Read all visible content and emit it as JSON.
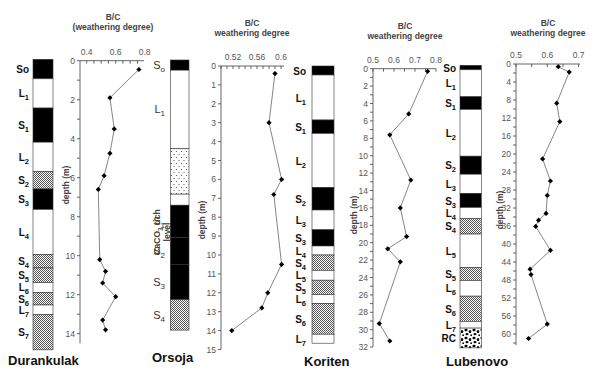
{
  "figure": {
    "depth_axis_label": "depth (m)",
    "x_axis_title_line1": "B/C",
    "calcium_label": "CaCO₃ rich level"
  },
  "colors": {
    "soil_black": "#000000",
    "loess_white": "#ffffff",
    "hatch": "#777777",
    "line": "#777777",
    "axis": "#555555"
  },
  "chart_data": [
    {
      "type": "line",
      "site": "Durankulak",
      "title": "B/C (weathering degree)",
      "xlabel": "B/C (weathering degree)",
      "ylabel": "depth (m)",
      "xlim": [
        0.4,
        0.8
      ],
      "ylim": [
        0,
        14.5
      ],
      "x_ticks": [
        "0.4",
        "0.6",
        "0.8"
      ],
      "y_ticks": [
        "0",
        "2",
        "4",
        "6",
        "8",
        "10",
        "12",
        "14"
      ],
      "depth": [
        0.45,
        1.9,
        3.5,
        4.75,
        5.9,
        6.6,
        10.2,
        10.8,
        11.4,
        12.1,
        13.3,
        13.8
      ],
      "values": [
        0.76,
        0.56,
        0.59,
        0.56,
        0.52,
        0.48,
        0.49,
        0.53,
        0.51,
        0.6,
        0.51,
        0.53
      ],
      "stratigraphy": [
        {
          "label": "So",
          "sub": "",
          "type": "soil",
          "top": 0.0,
          "bottom": 1.0
        },
        {
          "label": "L",
          "sub": "1",
          "type": "loess",
          "top": 1.0,
          "bottom": 2.5
        },
        {
          "label": "S",
          "sub": "1",
          "type": "soil",
          "top": 2.5,
          "bottom": 4.25
        },
        {
          "label": "L",
          "sub": "2",
          "type": "loess",
          "top": 4.25,
          "bottom": 5.75
        },
        {
          "label": "S",
          "sub": "2",
          "type": "hatch",
          "top": 5.75,
          "bottom": 6.65
        },
        {
          "label": "S",
          "sub": "3",
          "type": "soil",
          "top": 6.65,
          "bottom": 7.7
        },
        {
          "label": "L",
          "sub": "4",
          "type": "loess",
          "top": 7.7,
          "bottom": 10.0
        },
        {
          "label": "S",
          "sub": "4",
          "type": "hatch",
          "top": 10.0,
          "bottom": 10.7
        },
        {
          "label": "S",
          "sub": "5",
          "type": "hatch",
          "top": 10.7,
          "bottom": 11.45
        },
        {
          "label": "L",
          "sub": "6",
          "type": "loess",
          "top": 11.45,
          "bottom": 11.95
        },
        {
          "label": "S",
          "sub": "6",
          "type": "hatch",
          "top": 11.95,
          "bottom": 12.6
        },
        {
          "label": "L",
          "sub": "7",
          "type": "loess",
          "top": 12.6,
          "bottom": 13.1
        },
        {
          "label": "S",
          "sub": "7",
          "type": "hatch",
          "top": 13.1,
          "bottom": 14.9
        }
      ]
    },
    {
      "type": "line",
      "site": "Orsoja",
      "title": "B/C weathering degree",
      "xlabel": "B/C weathering degree",
      "ylabel": "depth (m)",
      "xlim": [
        0.5,
        0.605
      ],
      "ylim": [
        0,
        15
      ],
      "x_ticks": [
        "0.52",
        "0.56",
        "0.6"
      ],
      "y_ticks": [
        "0",
        "1",
        "2",
        "3",
        "4",
        "5",
        "6",
        "7",
        "8",
        "9",
        "10",
        "11",
        "12",
        "13",
        "14",
        "15"
      ],
      "depth": [
        0.4,
        3.0,
        6.0,
        6.8,
        10.5,
        12.0,
        12.8,
        14.0
      ],
      "values": [
        0.59,
        0.58,
        0.601,
        0.588,
        0.601,
        0.578,
        0.568,
        0.518
      ],
      "stratigraphy": [
        {
          "label": "S",
          "sub": "o",
          "type": "soil",
          "top": 0.0,
          "bottom": 0.55
        },
        {
          "label": "L",
          "sub": "1",
          "type": "loess",
          "top": 0.55,
          "bottom": 4.8
        },
        {
          "label": "",
          "sub": "",
          "type": "dotted",
          "top": 4.8,
          "bottom": 7.25
        },
        {
          "label": "",
          "sub": "",
          "type": "loess",
          "top": 7.25,
          "bottom": 7.85
        },
        {
          "label": "S",
          "sub": "1",
          "type": "soil",
          "top": 7.85,
          "bottom": 9.6
        },
        {
          "label": "S",
          "sub": "2",
          "type": "soil",
          "top": 9.6,
          "bottom": 11.05
        },
        {
          "label": "S",
          "sub": "3",
          "type": "soil",
          "top": 11.05,
          "bottom": 12.95
        },
        {
          "label": "S",
          "sub": "4",
          "type": "hatch",
          "top": 12.95,
          "bottom": 14.6
        }
      ]
    },
    {
      "type": "line",
      "site": "Koriten",
      "title": "B/C weathering degree",
      "xlabel": "B/C weathering degree",
      "ylabel": "depth (m)",
      "xlim": [
        0.5,
        0.8
      ],
      "ylim": [
        0,
        32
      ],
      "x_ticks": [
        "0.5",
        "0.6",
        "0.7",
        "0.8"
      ],
      "y_ticks": [
        "0",
        "2",
        "4",
        "6",
        "8",
        "10",
        "12",
        "14",
        "16",
        "18",
        "20",
        "22",
        "24",
        "26",
        "28",
        "30",
        "32"
      ],
      "depth": [
        0.3,
        5.2,
        7.6,
        12.8,
        16.0,
        19.3,
        20.7,
        22.2,
        29.3,
        31.3
      ],
      "values": [
        0.76,
        0.67,
        0.58,
        0.68,
        0.63,
        0.66,
        0.57,
        0.63,
        0.53,
        0.58
      ],
      "stratigraphy": [
        {
          "label": "So",
          "sub": "",
          "type": "soil",
          "top": 0.0,
          "bottom": 1.0
        },
        {
          "label": "L",
          "sub": "1",
          "type": "loess",
          "top": 1.0,
          "bottom": 6.0
        },
        {
          "label": "S",
          "sub": "1",
          "type": "soil",
          "top": 6.0,
          "bottom": 7.5
        },
        {
          "label": "L",
          "sub": "2",
          "type": "loess",
          "top": 7.5,
          "bottom": 13.5
        },
        {
          "label": "S",
          "sub": "2",
          "type": "soil",
          "top": 13.5,
          "bottom": 16.0
        },
        {
          "label": "L",
          "sub": "3",
          "type": "loess",
          "top": 16.0,
          "bottom": 18.2
        },
        {
          "label": "S",
          "sub": "3",
          "type": "soil",
          "top": 18.2,
          "bottom": 20.0
        },
        {
          "label": "L",
          "sub": "4",
          "type": "loess",
          "top": 20.0,
          "bottom": 21.0
        },
        {
          "label": "S",
          "sub": "4",
          "type": "hatch",
          "top": 21.0,
          "bottom": 22.7
        },
        {
          "label": "L",
          "sub": "5",
          "type": "loess",
          "top": 22.7,
          "bottom": 23.8
        },
        {
          "label": "S",
          "sub": "5",
          "type": "hatch",
          "top": 23.8,
          "bottom": 25.4
        },
        {
          "label": "L",
          "sub": "6",
          "type": "loess",
          "top": 25.4,
          "bottom": 26.4
        },
        {
          "label": "S",
          "sub": "6",
          "type": "hatch",
          "top": 26.4,
          "bottom": 29.8
        },
        {
          "label": "L",
          "sub": "7",
          "type": "loess",
          "top": 29.8,
          "bottom": 30.8
        }
      ]
    },
    {
      "type": "line",
      "site": "Lubenovo",
      "title": "B/C weathering degree",
      "xlabel": "B/C weathering degree",
      "ylabel": "depth (m)",
      "xlim": [
        0.5,
        0.7
      ],
      "ylim": [
        0,
        62
      ],
      "x_ticks": [
        "0.5",
        "0.6",
        "0.7"
      ],
      "y_ticks": [
        "0",
        "4",
        "8",
        "12",
        "16",
        "20",
        "24",
        "28",
        "32",
        "36",
        "40",
        "44",
        "48",
        "52",
        "56",
        "60"
      ],
      "depth": [
        0.6,
        1.8,
        8.7,
        12.8,
        21.1,
        26.0,
        29.2,
        33.2,
        34.7,
        36.1,
        41.4,
        45.6,
        46.8,
        57.8,
        61.0
      ],
      "values": [
        0.635,
        0.67,
        0.63,
        0.64,
        0.585,
        0.61,
        0.6,
        0.596,
        0.572,
        0.563,
        0.61,
        0.545,
        0.548,
        0.6,
        0.54
      ],
      "stratigraphy": [
        {
          "label": "So",
          "sub": "",
          "type": "soil",
          "top": 0.0,
          "bottom": 1.0
        },
        {
          "label": "L",
          "sub": "1",
          "type": "loess",
          "top": 1.0,
          "bottom": 7.0
        },
        {
          "label": "S",
          "sub": "1",
          "type": "soil",
          "top": 7.0,
          "bottom": 9.8
        },
        {
          "label": "L",
          "sub": "2",
          "type": "loess",
          "top": 9.8,
          "bottom": 20.2
        },
        {
          "label": "S",
          "sub": "2",
          "type": "soil",
          "top": 20.2,
          "bottom": 24.2
        },
        {
          "label": "L",
          "sub": "3",
          "type": "loess",
          "top": 24.2,
          "bottom": 28.5
        },
        {
          "label": "S",
          "sub": "3",
          "type": "soil",
          "top": 28.5,
          "bottom": 31.6
        },
        {
          "label": "L",
          "sub": "4",
          "type": "loess",
          "top": 31.6,
          "bottom": 34.1
        },
        {
          "label": "S",
          "sub": "4",
          "type": "hatch",
          "top": 34.1,
          "bottom": 37.5
        },
        {
          "label": "L",
          "sub": "5",
          "type": "loess",
          "top": 37.5,
          "bottom": 44.9
        },
        {
          "label": "S",
          "sub": "5",
          "type": "hatch",
          "top": 44.9,
          "bottom": 47.8
        },
        {
          "label": "L",
          "sub": "6",
          "type": "loess",
          "top": 47.8,
          "bottom": 51.3
        },
        {
          "label": "S",
          "sub": "6",
          "type": "hatch",
          "top": 51.3,
          "bottom": 56.9
        },
        {
          "label": "L",
          "sub": "7",
          "type": "loess",
          "top": 56.9,
          "bottom": 58.4
        },
        {
          "label": "RC",
          "sub": "",
          "type": "pebbles",
          "top": 58.4,
          "bottom": 62.8
        }
      ]
    }
  ]
}
